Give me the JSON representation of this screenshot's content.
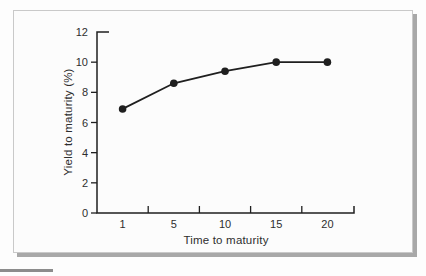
{
  "figure": {
    "page_background": "#fdfdfd",
    "frame_background": "#fcfcfc",
    "frame_border_color": "#c9c9c9",
    "frame_shadow_color": "#a8a8a8",
    "cropped_bottom_bar_color": "#8c8c8c"
  },
  "chart_data": {
    "type": "line",
    "title": "",
    "xlabel": "Time to maturity",
    "ylabel": "Yield to maturity (%)",
    "categories": [
      "1",
      "5",
      "10",
      "15",
      "20"
    ],
    "values": [
      6.9,
      8.6,
      9.4,
      10.0,
      10.0
    ],
    "series": [
      {
        "name": "yield-curve",
        "values": [
          6.9,
          8.6,
          9.4,
          10.0,
          10.0
        ]
      }
    ],
    "y_ticks": [
      0,
      2,
      4,
      6,
      8,
      10,
      12
    ],
    "ylim": [
      0,
      12
    ],
    "grid": false,
    "legend": "none",
    "line_color": "#1f1f1f",
    "marker": "filled-circle",
    "text_color": "#2e2e2e",
    "tick_style": "x-ticks-at-category-boundaries-pointing-up, y-ticks-pointing-left, axis-end-caps"
  }
}
